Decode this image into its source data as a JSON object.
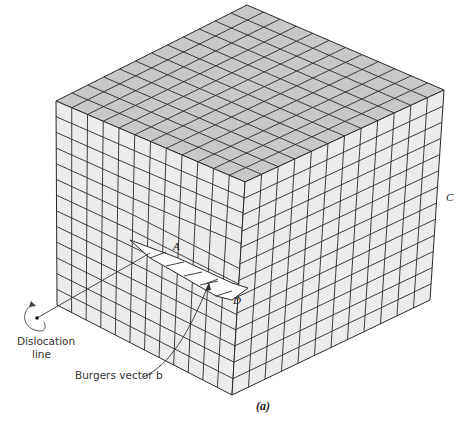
{
  "figure": {
    "caption": "(a)",
    "type": "edge dislocation lattice cube",
    "labels": {
      "A": "A",
      "C": "C",
      "D": "D",
      "dislocation_line_1": "Dislocation",
      "dislocation_line_2": "line",
      "burgers_vector": "Burgers vector b"
    },
    "colors": {
      "top_face": "#c8c8c8",
      "side_face": "#ececec",
      "grid_line": "#2a2a2a",
      "background": "#ffffff"
    },
    "grid": {
      "left_face_columns": 12,
      "right_face_columns": 12,
      "rows": 13
    },
    "vertices": {
      "top": [
        247,
        5
      ],
      "left_top": [
        56,
        101
      ],
      "front_top": [
        245,
        182
      ],
      "right_top": [
        444,
        90
      ],
      "left_bottom": [
        57,
        305
      ],
      "front_bottom": [
        232,
        395
      ],
      "right_bottom": [
        430,
        300
      ]
    }
  }
}
